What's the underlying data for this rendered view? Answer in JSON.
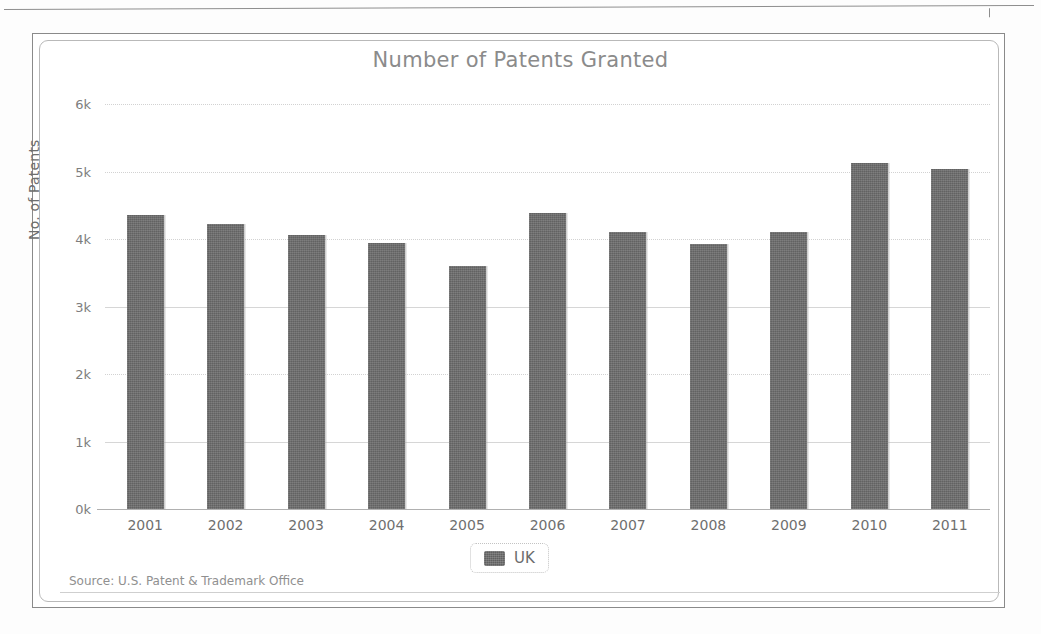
{
  "page": {
    "background": "#fdfdfd",
    "rule_present": true
  },
  "chart_card": {
    "frame_color": "#8a8a8a",
    "inner_frame_color": "#b9b9b9",
    "background": "#ffffff"
  },
  "legend": {
    "position": "bottom-center",
    "entries": [
      {
        "label": "UK",
        "color": "#6b6b6b",
        "swatch_icon": "series-swatch-icon"
      }
    ]
  },
  "source": {
    "text": "Source: U.S. Patent & Trademark Office"
  },
  "chart_data": {
    "type": "bar",
    "title": "Number of Patents Granted",
    "xlabel": "",
    "ylabel": "No. of Patents",
    "categories": [
      "2001",
      "2002",
      "2003",
      "2004",
      "2005",
      "2006",
      "2007",
      "2008",
      "2009",
      "2010",
      "2011"
    ],
    "series": [
      {
        "name": "UK",
        "color": "#6b6b6b",
        "values": [
          4360,
          4220,
          4060,
          3940,
          3600,
          4390,
          4110,
          3930,
          4110,
          5120,
          5040
        ]
      }
    ],
    "ylim": [
      0,
      6000
    ],
    "ytick_values": [
      0,
      1000,
      2000,
      3000,
      4000,
      5000,
      6000
    ],
    "ytick_labels": [
      "0k",
      "1k",
      "2k",
      "3k",
      "4k",
      "5k",
      "6k"
    ],
    "grid": true,
    "grid_axis": "y",
    "legend_position": "bottom",
    "annotations": [
      "Source: U.S. Patent & Trademark Office"
    ]
  }
}
